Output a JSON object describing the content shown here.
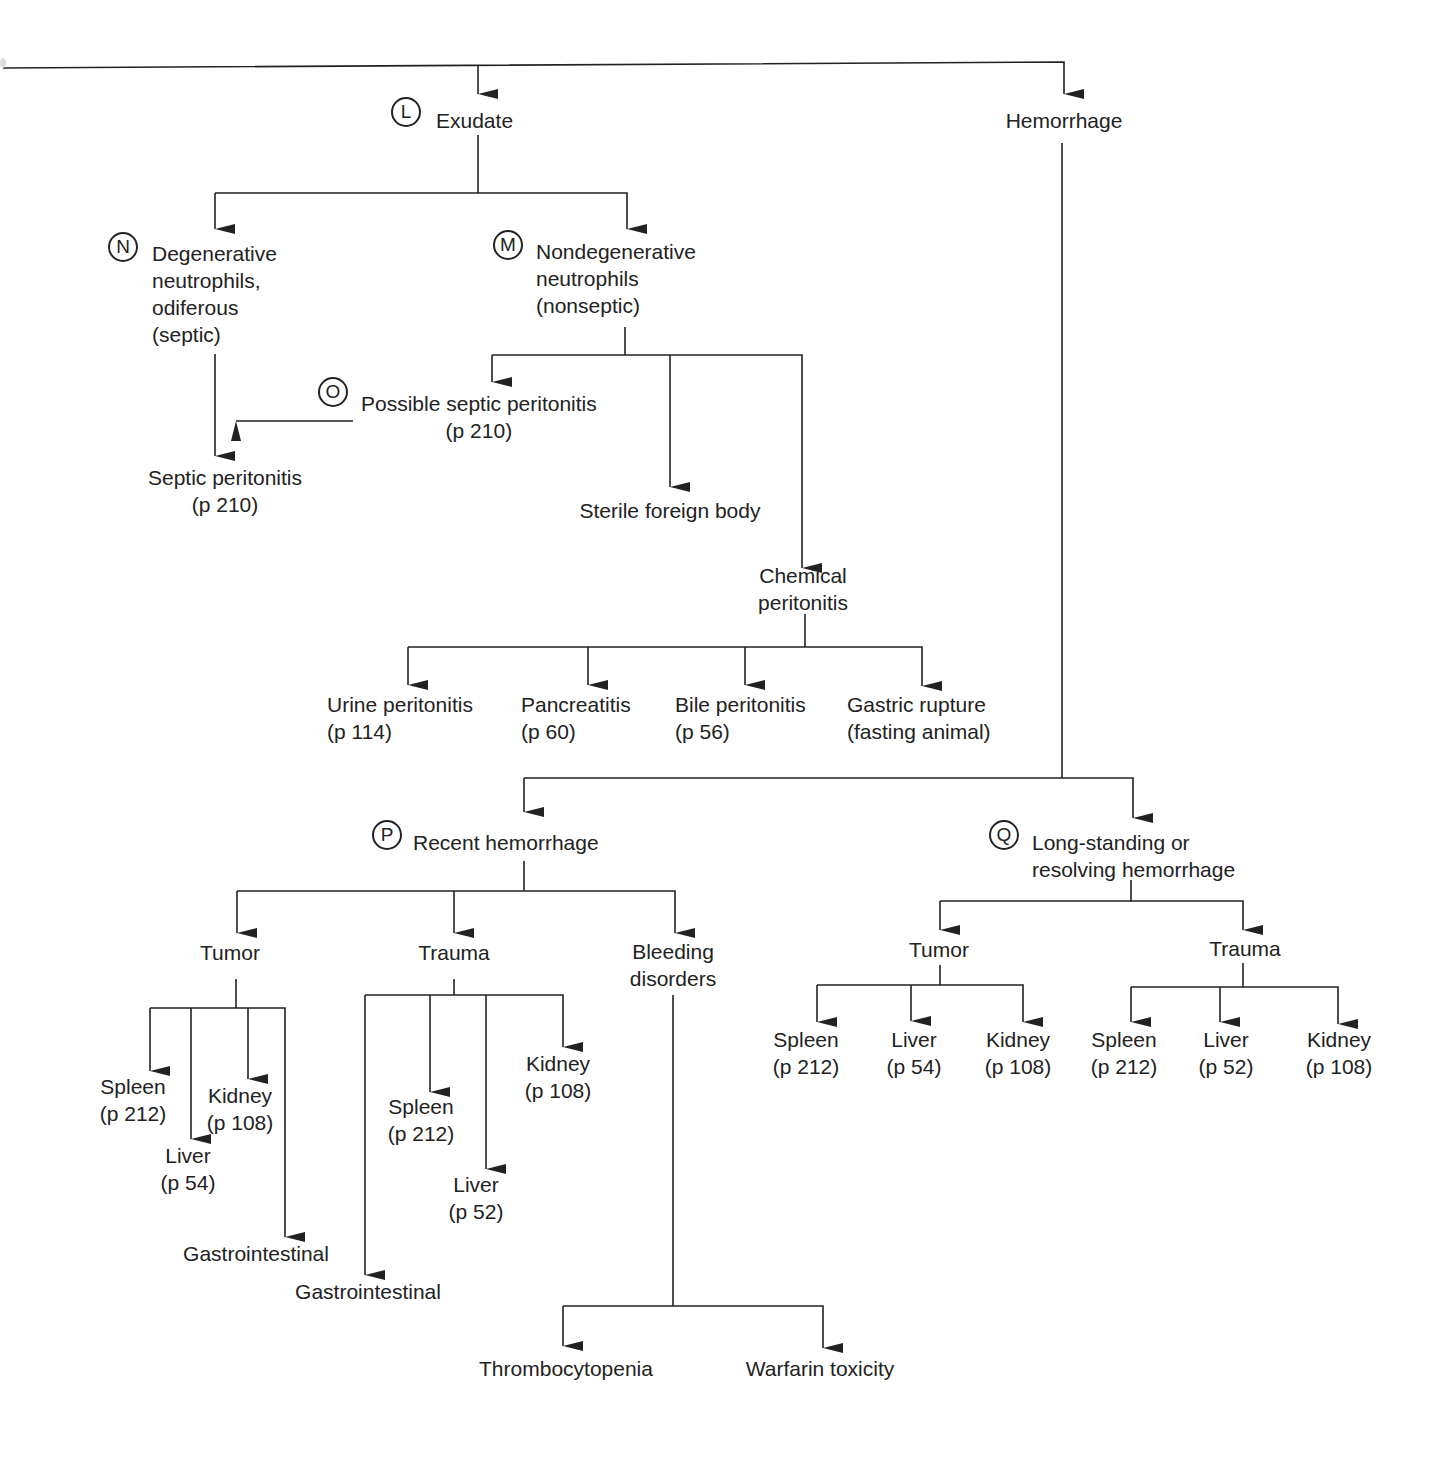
{
  "diagram": {
    "type": "flowchart",
    "nodes": {
      "exudate": {
        "badge": "L",
        "label": "Exudate"
      },
      "hemorrhage": {
        "label": "Hemorrhage"
      },
      "degenerative": {
        "badge": "N",
        "lines": [
          "Degenerative",
          "neutrophils,",
          "odiferous",
          "(septic)"
        ]
      },
      "nondegenerative": {
        "badge": "M",
        "lines": [
          "Nondegenerative",
          "neutrophils",
          "(nonseptic)"
        ]
      },
      "possible_septic": {
        "badge": "O",
        "lines": [
          "Possible septic peritonitis",
          "(p 210)"
        ]
      },
      "septic_peritonitis": {
        "lines": [
          "Septic peritonitis",
          "(p 210)"
        ]
      },
      "sterile_foreign_body": {
        "label": "Sterile foreign body"
      },
      "chemical_peritonitis": {
        "lines": [
          "Chemical",
          "peritonitis"
        ]
      },
      "urine_peritonitis": {
        "lines": [
          "Urine peritonitis",
          "(p 114)"
        ]
      },
      "pancreatitis": {
        "lines": [
          "Pancreatitis",
          "(p 60)"
        ]
      },
      "bile_peritonitis": {
        "lines": [
          "Bile peritonitis",
          "(p 56)"
        ]
      },
      "gastric_rupture": {
        "lines": [
          "Gastric rupture",
          "(fasting animal)"
        ]
      },
      "recent_hemorrhage": {
        "badge": "P",
        "label": "Recent hemorrhage"
      },
      "longstanding_hemorrhage": {
        "badge": "Q",
        "lines": [
          "Long-standing or",
          "resolving hemorrhage"
        ]
      },
      "recent_tumor": {
        "label": "Tumor"
      },
      "recent_trauma": {
        "label": "Trauma"
      },
      "bleeding_disorders": {
        "lines": [
          "Bleeding",
          "disorders"
        ]
      },
      "rt_spleen": {
        "lines": [
          "Spleen",
          "(p 212)"
        ]
      },
      "rt_liver": {
        "lines": [
          "Liver",
          "(p 54)"
        ]
      },
      "rt_kidney": {
        "lines": [
          "Kidney",
          "(p 108)"
        ]
      },
      "rt_gi": {
        "label": "Gastrointestinal"
      },
      "rtr_spleen": {
        "lines": [
          "Spleen",
          "(p 212)"
        ]
      },
      "rtr_liver": {
        "lines": [
          "Liver",
          "(p 52)"
        ]
      },
      "rtr_kidney": {
        "lines": [
          "Kidney",
          "(p 108)"
        ]
      },
      "rtr_gi": {
        "label": "Gastrointestinal"
      },
      "thrombocytopenia": {
        "label": "Thrombocytopenia"
      },
      "warfarin": {
        "label": "Warfarin toxicity"
      },
      "lt_tumor": {
        "label": "Tumor"
      },
      "lt_trauma": {
        "label": "Trauma"
      },
      "lt_spleen": {
        "lines": [
          "Spleen",
          "(p 212)"
        ]
      },
      "lt_liver": {
        "lines": [
          "Liver",
          "(p 54)"
        ]
      },
      "lt_kidney": {
        "lines": [
          "Kidney",
          "(p 108)"
        ]
      },
      "ltr_spleen": {
        "lines": [
          "Spleen",
          "(p 212)"
        ]
      },
      "ltr_liver": {
        "lines": [
          "Liver",
          "(p 52)"
        ]
      },
      "ltr_kidney": {
        "lines": [
          "Kidney",
          "(p 108)"
        ]
      }
    },
    "edges": [
      [
        "root",
        "exudate"
      ],
      [
        "root",
        "hemorrhage"
      ],
      [
        "exudate",
        "degenerative"
      ],
      [
        "exudate",
        "nondegenerative"
      ],
      [
        "degenerative",
        "septic_peritonitis"
      ],
      [
        "possible_septic",
        "septic_peritonitis"
      ],
      [
        "nondegenerative",
        "possible_septic"
      ],
      [
        "nondegenerative",
        "sterile_foreign_body"
      ],
      [
        "nondegenerative",
        "chemical_peritonitis"
      ],
      [
        "chemical_peritonitis",
        "urine_peritonitis"
      ],
      [
        "chemical_peritonitis",
        "pancreatitis"
      ],
      [
        "chemical_peritonitis",
        "bile_peritonitis"
      ],
      [
        "chemical_peritonitis",
        "gastric_rupture"
      ],
      [
        "hemorrhage",
        "recent_hemorrhage"
      ],
      [
        "hemorrhage",
        "longstanding_hemorrhage"
      ],
      [
        "recent_hemorrhage",
        "recent_tumor"
      ],
      [
        "recent_hemorrhage",
        "recent_trauma"
      ],
      [
        "recent_hemorrhage",
        "bleeding_disorders"
      ],
      [
        "recent_tumor",
        "rt_spleen"
      ],
      [
        "recent_tumor",
        "rt_liver"
      ],
      [
        "recent_tumor",
        "rt_kidney"
      ],
      [
        "recent_tumor",
        "rt_gi"
      ],
      [
        "recent_trauma",
        "rtr_spleen"
      ],
      [
        "recent_trauma",
        "rtr_liver"
      ],
      [
        "recent_trauma",
        "rtr_kidney"
      ],
      [
        "recent_trauma",
        "rtr_gi"
      ],
      [
        "bleeding_disorders",
        "thrombocytopenia"
      ],
      [
        "bleeding_disorders",
        "warfarin"
      ],
      [
        "longstanding_hemorrhage",
        "lt_tumor"
      ],
      [
        "longstanding_hemorrhage",
        "lt_trauma"
      ],
      [
        "lt_tumor",
        "lt_spleen"
      ],
      [
        "lt_tumor",
        "lt_liver"
      ],
      [
        "lt_tumor",
        "lt_kidney"
      ],
      [
        "lt_trauma",
        "ltr_spleen"
      ],
      [
        "lt_trauma",
        "ltr_liver"
      ],
      [
        "lt_trauma",
        "ltr_kidney"
      ]
    ]
  }
}
